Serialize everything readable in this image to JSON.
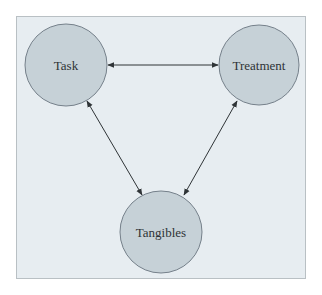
{
  "diagram": {
    "colors": {
      "background": "#e7edf1",
      "frame_border": "#b9c0c4",
      "node_fill": "#c6d1d7",
      "node_stroke": "#75808a",
      "edge": "#2f3437",
      "text": "#2e3336"
    },
    "nodes": [
      {
        "id": "task",
        "label": "Task",
        "cx": 66,
        "cy": 65,
        "r": 41
      },
      {
        "id": "treatment",
        "label": "Treatment",
        "cx": 259,
        "cy": 65,
        "r": 40
      },
      {
        "id": "tangibles",
        "label": "Tangibles",
        "cx": 161,
        "cy": 232,
        "r": 41
      }
    ],
    "edges": [
      {
        "from": "task",
        "to": "treatment",
        "direction": "bidirectional"
      },
      {
        "from": "task",
        "to": "tangibles",
        "direction": "bidirectional"
      },
      {
        "from": "treatment",
        "to": "tangibles",
        "direction": "bidirectional"
      }
    ]
  }
}
